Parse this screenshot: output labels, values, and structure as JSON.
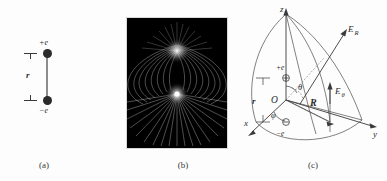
{
  "figure": {
    "background_color": "#fdfdfd",
    "ink_color": "#2b2b2b"
  },
  "panels": [
    {
      "id": "a",
      "caption": "(a)",
      "description": "Vertical electric dipole: positive charge above negative charge separated by distance r",
      "labels": {
        "positive_charge": "+e",
        "negative_charge": "−e",
        "separation": "r"
      }
    },
    {
      "id": "b",
      "caption": "(b)",
      "description": "Dipole electric field line visualization on black background",
      "background_color": "#000000",
      "field_line_color": "#d9d9d9",
      "pole_glow_color": "#ffffff"
    },
    {
      "id": "c",
      "caption": "(c)",
      "description": "Spherical coordinate system with dipole at origin showing field components",
      "labels": {
        "axis_x": "x",
        "axis_y": "y",
        "axis_z": "z",
        "origin": "O",
        "positive_charge": "+e",
        "negative_charge": "−e",
        "separation": "r",
        "radial_vector": "R",
        "polar_angle": "θ",
        "azimuthal_angle": "φ",
        "field_radial": "E",
        "field_radial_sub": "R",
        "field_polar": "E",
        "field_polar_sub": "θ"
      }
    }
  ]
}
